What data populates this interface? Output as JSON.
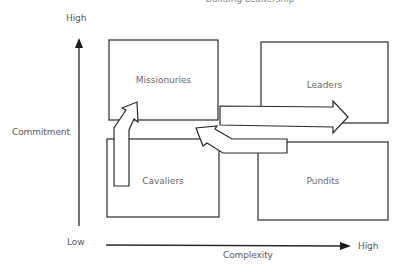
{
  "diagram": {
    "title": "Building Leadership",
    "y_axis": {
      "label": "Commitment",
      "high_label": "High",
      "low_label": "Low"
    },
    "x_axis": {
      "label": "Complexity",
      "high_label": "High"
    },
    "quadrants": [
      {
        "id": "top-left",
        "label": "Missionuries"
      },
      {
        "id": "top-right",
        "label": "Leaders"
      },
      {
        "id": "bottom-left",
        "label": "Cavaliers"
      },
      {
        "id": "bottom-right",
        "label": "Pundits"
      }
    ],
    "arrows": [
      {
        "from": "Cavaliers",
        "to": "Missionuries",
        "direction": "up"
      },
      {
        "from": "Missionuries",
        "to": "Leaders",
        "direction": "right"
      },
      {
        "from": "Pundits",
        "to": "Missionuries",
        "direction": "left-up"
      }
    ],
    "colors": {
      "stroke": "#2a2a2a",
      "text": "#5a5a5a",
      "background": "#ffffff"
    }
  }
}
